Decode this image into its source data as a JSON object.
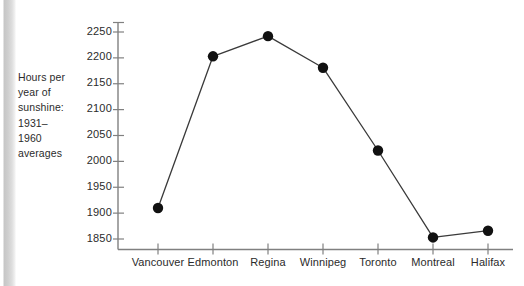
{
  "figure": {
    "y_axis_title_lines": [
      "Hours per",
      "year of",
      "sunshine:",
      "1931–",
      "1960",
      "averages"
    ]
  },
  "chart_data": {
    "type": "line",
    "title": "",
    "subtitle": "",
    "xlabel": "",
    "ylabel": "Hours per year of sunshine: 1931–1960 averages",
    "categories": [
      "Vancouver",
      "Edmonton",
      "Regina",
      "Winnipeg",
      "Toronto",
      "Montreal",
      "Halifax"
    ],
    "values": [
      1910,
      2203,
      2242,
      2181,
      2021,
      1853,
      1866
    ],
    "series": [
      {
        "name": "Hours of sunshine",
        "values": [
          1910,
          2203,
          2242,
          2181,
          2021,
          1853,
          1866
        ]
      }
    ],
    "ylim": [
      1840,
      2265
    ],
    "yticks": [
      1850,
      1900,
      1950,
      2000,
      2050,
      2100,
      2150,
      2200,
      2250
    ],
    "ytick_labels": [
      "1850",
      "1900",
      "1950",
      "2000",
      "2050",
      "2100",
      "2150",
      "2200",
      "2250"
    ],
    "grid": false,
    "legend": false,
    "legend_position": "none",
    "marker": "filled-circle",
    "marker_color": "#111111",
    "line_color": "#3a3a3a",
    "axis_color": "#808080",
    "background_color": "#ffffff"
  }
}
